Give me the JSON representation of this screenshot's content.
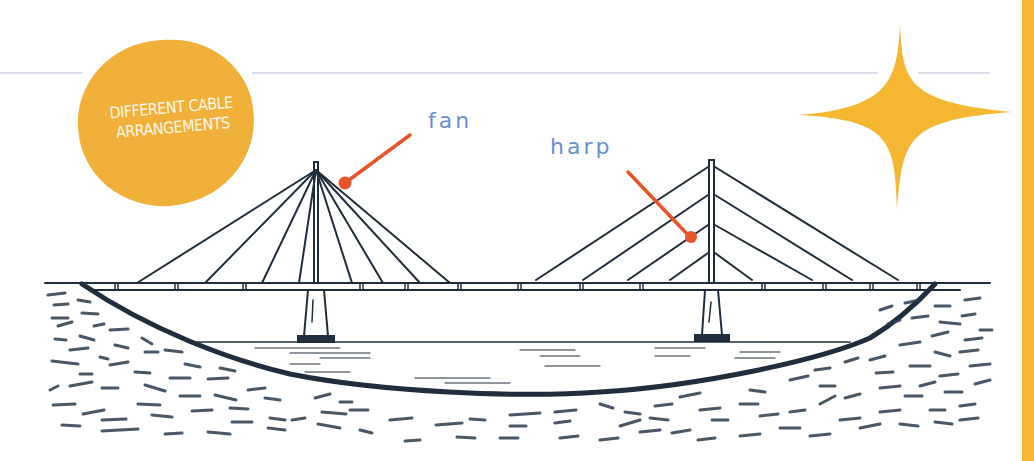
{
  "badge": {
    "line1": "DIFFERENT CABLE",
    "line2": "ARRANGEMENTS",
    "color": "#f1b03a"
  },
  "labels": {
    "fan": "fan",
    "harp": "harp",
    "label_color": "#6a8fcf",
    "pointer_color": "#e8542a"
  },
  "illustration": {
    "subject": "cable-stayed bridge",
    "towers": [
      {
        "type": "fan",
        "cables_per_side": 4
      },
      {
        "type": "harp",
        "cables_per_side": 4
      }
    ],
    "accent_color": "#f5b731",
    "ink_color": "#1f2d3d"
  }
}
